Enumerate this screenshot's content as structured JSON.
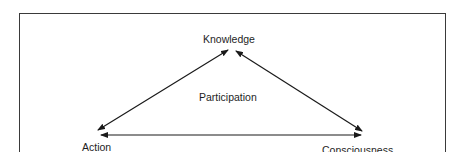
{
  "diagram": {
    "type": "triangle-relationship",
    "nodes": [
      {
        "id": "knowledge",
        "label": "Knowledge",
        "position": "top"
      },
      {
        "id": "action",
        "label": "Action",
        "position": "bottom-left"
      },
      {
        "id": "consciousness",
        "label": "Consciousness",
        "position": "bottom-right"
      }
    ],
    "center_label": "Participation",
    "edges": [
      {
        "from": "action",
        "to": "knowledge",
        "direction": "bidirectional"
      },
      {
        "from": "knowledge",
        "to": "consciousness",
        "direction": "bidirectional"
      },
      {
        "from": "action",
        "to": "consciousness",
        "direction": "bidirectional"
      }
    ],
    "colors": {
      "line": "#1a1a1a",
      "frame": "#3a3a3a",
      "background": "#ffffff"
    }
  }
}
